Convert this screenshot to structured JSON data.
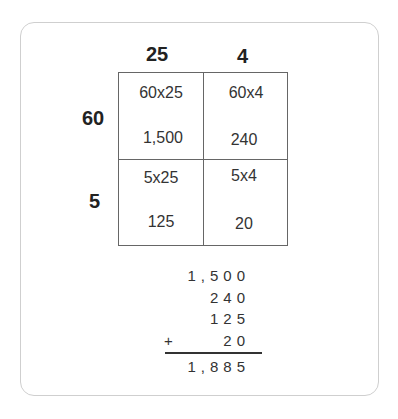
{
  "header": {
    "col1": "25",
    "col2": "4",
    "row1": "60",
    "row2": "5"
  },
  "cells": {
    "r1c1": {
      "expr": "60x25",
      "value": "1,500"
    },
    "r1c2": {
      "expr": "60x4",
      "value": "240"
    },
    "r2c1": {
      "expr": "5x25",
      "value": "125"
    },
    "r2c2": {
      "expr": "5x4",
      "value": "20"
    }
  },
  "addition": {
    "rows": [
      "1,500",
      "240",
      "125",
      "20"
    ],
    "operator": "+",
    "total": "1,885"
  }
}
